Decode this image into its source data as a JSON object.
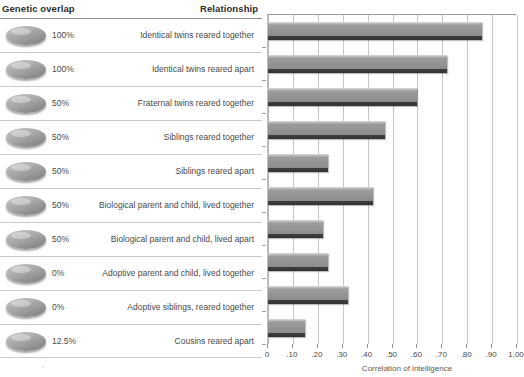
{
  "headers": {
    "genetic_overlap": "Genetic overlap",
    "relationship": "Relationship"
  },
  "rows": [
    {
      "overlap": "100%",
      "relationship": "Identical twins reared together"
    },
    {
      "overlap": "100%",
      "relationship": "Identical twins reared apart"
    },
    {
      "overlap": "50%",
      "relationship": "Fraternal twins reared together"
    },
    {
      "overlap": "50%",
      "relationship": "Siblings reared together"
    },
    {
      "overlap": "50%",
      "relationship": "Siblings reared apart"
    },
    {
      "overlap": "50%",
      "relationship": "Biological parent and child, lived together"
    },
    {
      "overlap": "50%",
      "relationship": "Biological parent and child, lived apart"
    },
    {
      "overlap": "0%",
      "relationship": "Adoptive parent and child, lived together"
    },
    {
      "overlap": "0%",
      "relationship": "Adoptive siblings, reared together"
    },
    {
      "overlap": "12.5%",
      "relationship": "Cousins reared apart"
    }
  ],
  "chart_data": {
    "type": "bar",
    "orientation": "horizontal",
    "title": "",
    "xlabel": "Correlation of intelligence",
    "ylabel": "",
    "xlim": [
      0,
      1.0
    ],
    "grid": true,
    "legend": null,
    "categories": [
      "Identical twins reared together",
      "Identical twins reared apart",
      "Fraternal twins reared together",
      "Siblings reared together",
      "Siblings reared apart",
      "Biological parent and child, lived together",
      "Biological parent and child, lived apart",
      "Adoptive parent and child, lived together",
      "Adoptive siblings, reared together",
      "Cousins reared apart"
    ],
    "values": [
      0.86,
      0.72,
      0.6,
      0.47,
      0.24,
      0.42,
      0.22,
      0.24,
      0.32,
      0.15
    ],
    "tick_labels": [
      "0",
      ".10",
      ".20",
      ".30",
      ".40",
      ".50",
      ".60",
      ".70",
      ".80",
      ".90",
      "1.00"
    ],
    "tick_values": [
      0,
      0.1,
      0.2,
      0.3,
      0.4,
      0.5,
      0.6,
      0.7,
      0.8,
      0.9,
      1.0
    ],
    "bar_color": "#8f8f8f"
  },
  "icons": {
    "pill": "ellipse-chip-icon"
  }
}
